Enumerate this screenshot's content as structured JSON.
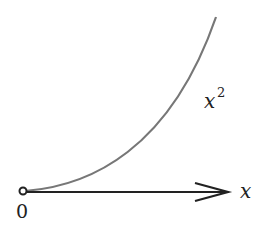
{
  "diagram": {
    "curve_label": "x",
    "curve_exponent": "2",
    "axis_label": "x",
    "origin_label": "0",
    "colors": {
      "curve": "#777777",
      "axis": "#222222",
      "text": "#222222"
    }
  }
}
